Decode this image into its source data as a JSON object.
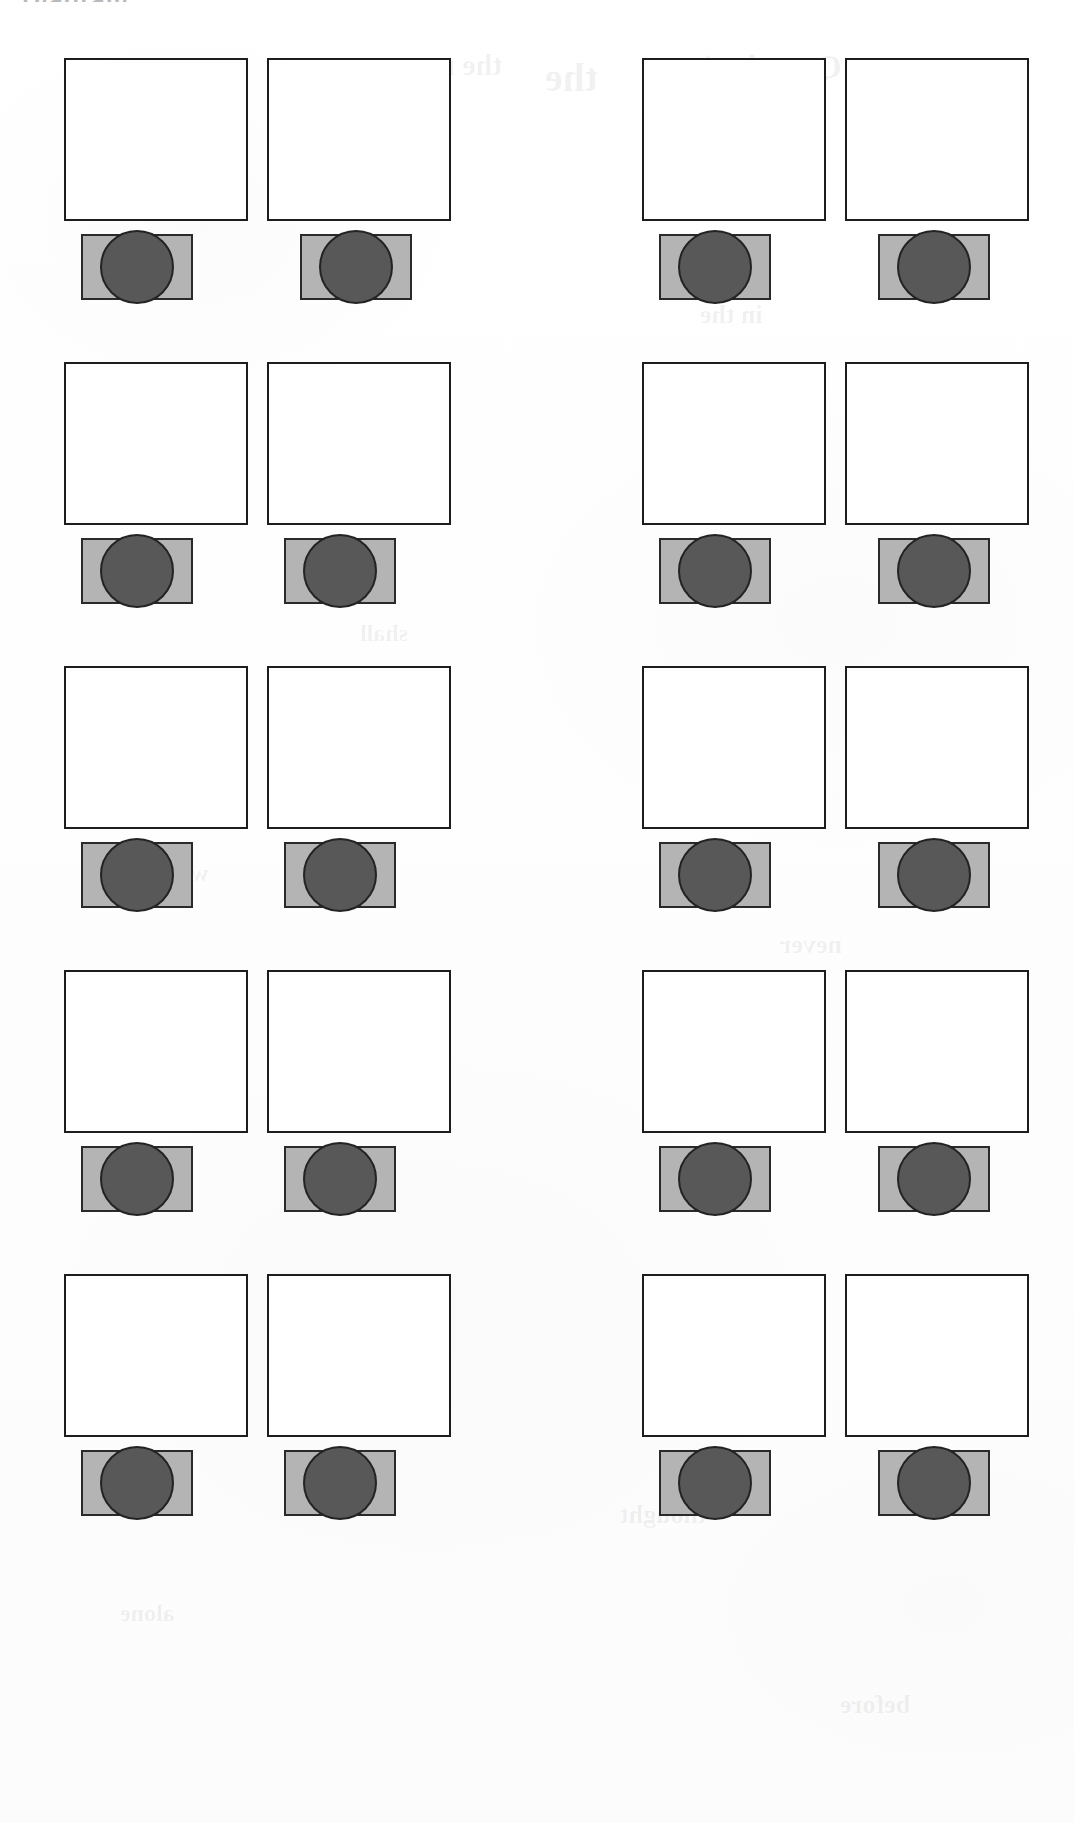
{
  "page": {
    "width": 1074,
    "height": 1823,
    "background_color": "#fdfdfd",
    "document_type": "scanned-page",
    "clipped_heading_fragment": "Diagram"
  },
  "palette": {
    "page_background": "#fdfdfd",
    "outline_square_fill": "#ffffff",
    "outline_square_border": "#1d1d1d",
    "shaded_block_fill": "#b4b4b4",
    "shaded_block_border": "#2a2a2a",
    "disc_fill": "#585858",
    "disc_border": "#232323",
    "ghost_text_color": "rgba(40,40,48,0.065)"
  },
  "grid": {
    "rows": 5,
    "columns": 4,
    "column_groups": 2,
    "columns_per_group": 2,
    "unit_description": "empty outlined square above a shaded rectangle containing a dark circle",
    "row_tops": [
      58,
      362,
      666,
      970,
      1274
    ],
    "column_lefts": [
      64,
      267,
      642,
      845
    ],
    "unit_outline_square_size": [
      184,
      163
    ],
    "unit_shaded_block_size": [
      112,
      66
    ],
    "unit_disc_diameter": 74
  },
  "units": [
    {
      "id": "r1c1",
      "row": 1,
      "col": 1,
      "left": 64,
      "top": 58,
      "disc_align": "left"
    },
    {
      "id": "r1c2",
      "row": 1,
      "col": 2,
      "left": 267,
      "top": 58,
      "disc_align": "right"
    },
    {
      "id": "r1c3",
      "row": 1,
      "col": 3,
      "left": 642,
      "top": 58,
      "disc_align": "left"
    },
    {
      "id": "r1c4",
      "row": 1,
      "col": 4,
      "left": 845,
      "top": 58,
      "disc_align": "right"
    },
    {
      "id": "r2c1",
      "row": 2,
      "col": 1,
      "left": 64,
      "top": 362,
      "disc_align": "left"
    },
    {
      "id": "r2c2",
      "row": 2,
      "col": 2,
      "left": 267,
      "top": 362,
      "disc_align": "left"
    },
    {
      "id": "r2c3",
      "row": 2,
      "col": 3,
      "left": 642,
      "top": 362,
      "disc_align": "left"
    },
    {
      "id": "r2c4",
      "row": 2,
      "col": 4,
      "left": 845,
      "top": 362,
      "disc_align": "right"
    },
    {
      "id": "r3c1",
      "row": 3,
      "col": 1,
      "left": 64,
      "top": 666,
      "disc_align": "left"
    },
    {
      "id": "r3c2",
      "row": 3,
      "col": 2,
      "left": 267,
      "top": 666,
      "disc_align": "left"
    },
    {
      "id": "r3c3",
      "row": 3,
      "col": 3,
      "left": 642,
      "top": 666,
      "disc_align": "left"
    },
    {
      "id": "r3c4",
      "row": 3,
      "col": 4,
      "left": 845,
      "top": 666,
      "disc_align": "right"
    },
    {
      "id": "r4c1",
      "row": 4,
      "col": 1,
      "left": 64,
      "top": 970,
      "disc_align": "left"
    },
    {
      "id": "r4c2",
      "row": 4,
      "col": 2,
      "left": 267,
      "top": 970,
      "disc_align": "left"
    },
    {
      "id": "r4c3",
      "row": 4,
      "col": 3,
      "left": 642,
      "top": 970,
      "disc_align": "left"
    },
    {
      "id": "r4c4",
      "row": 4,
      "col": 4,
      "left": 845,
      "top": 970,
      "disc_align": "right"
    },
    {
      "id": "r5c1",
      "row": 5,
      "col": 1,
      "left": 64,
      "top": 1274,
      "disc_align": "left"
    },
    {
      "id": "r5c2",
      "row": 5,
      "col": 2,
      "left": 267,
      "top": 1274,
      "disc_align": "left"
    },
    {
      "id": "r5c3",
      "row": 5,
      "col": 3,
      "left": 642,
      "top": 1274,
      "disc_align": "left"
    },
    {
      "id": "r5c4",
      "row": 5,
      "col": 4,
      "left": 845,
      "top": 1274,
      "disc_align": "right"
    }
  ],
  "show_through_text": [
    {
      "text": "the",
      "left": 545,
      "top": 54,
      "size": 40
    },
    {
      "text": "Question)",
      "left": 700,
      "top": 48,
      "size": 34
    },
    {
      "text": "the murmur",
      "left": 345,
      "top": 48,
      "size": 30
    },
    {
      "text": "and",
      "left": 118,
      "top": 276,
      "size": 26
    },
    {
      "text": "shall",
      "left": 360,
      "top": 620,
      "size": 24
    },
    {
      "text": "in the",
      "left": 700,
      "top": 300,
      "size": 26
    },
    {
      "text": "water",
      "left": 150,
      "top": 860,
      "size": 24
    },
    {
      "text": "never",
      "left": 780,
      "top": 930,
      "size": 26
    },
    {
      "text": "of them",
      "left": 300,
      "top": 1180,
      "size": 24
    },
    {
      "text": "thought",
      "left": 620,
      "top": 1500,
      "size": 26
    },
    {
      "text": "alone",
      "left": 120,
      "top": 1600,
      "size": 24
    },
    {
      "text": "before",
      "left": 840,
      "top": 1690,
      "size": 26
    }
  ]
}
